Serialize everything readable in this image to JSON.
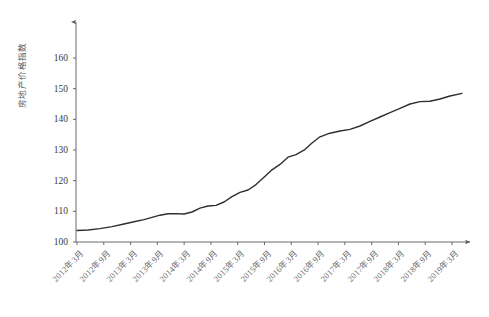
{
  "page": {
    "header_strip": "",
    "background_color": "#ffffff"
  },
  "chart_data": {
    "type": "line",
    "title": "",
    "subtitle": "",
    "xlabel": "",
    "ylabel": "房地产价格指数",
    "ylim": [
      100,
      165
    ],
    "ytick_values": [
      100,
      110,
      120,
      130,
      140,
      150,
      160
    ],
    "ytick_labels": [
      "100",
      "110",
      "120",
      "130",
      "140",
      "150",
      "160"
    ],
    "grid": false,
    "legend": false,
    "legend_position": "none",
    "line_color": "#2f2f2f",
    "line_width": 1.4,
    "axis_color": "#5b5b5b",
    "axis_arrow": true,
    "xtick_labels": [
      "2012年3月",
      "2012年9月",
      "2013年3月",
      "2013年9月",
      "2014年3月",
      "2014年9月",
      "2015年3月",
      "2015年9月",
      "2016年3月",
      "2016年9月",
      "2017年3月",
      "2017年9月",
      "2018年3月",
      "2018年9月",
      "2019年3月"
    ],
    "xtick_rotation_deg": -45,
    "x": [
      "2012年3月",
      "2012年6月",
      "2012年9月",
      "2012年12月",
      "2013年3月",
      "2013年6月",
      "2013年9月",
      "2013年12月",
      "2014年3月",
      "2014年6月",
      "2014年9月",
      "2014年12月",
      "2015年3月",
      "2015年6月",
      "2015年9月",
      "2015年12月",
      "2016年3月",
      "2016年6月",
      "2016年9月",
      "2016年12月",
      "2017年3月",
      "2017年6月",
      "2017年9月",
      "2017年12月",
      "2018年3月",
      "2018年6月",
      "2018年9月",
      "2018年12月",
      "2019年3月"
    ],
    "values": [
      104.0,
      104.2,
      104.6,
      105.3,
      106.2,
      107.1,
      108.0,
      109.0,
      110.0,
      110.6,
      110.7,
      110.6,
      111.2,
      112.5,
      113.2,
      113.4,
      114.6,
      116.4,
      117.8,
      118.6,
      120.4,
      122.8,
      125.2,
      127.0,
      129.4,
      130.2,
      131.6,
      134.0,
      136.0
    ],
    "series": [
      {
        "name": "房地产价格指数",
        "values": [
          104.0,
          104.2,
          104.6,
          105.3,
          106.2,
          107.1,
          108.0,
          109.0,
          110.0,
          110.6,
          110.7,
          110.6,
          111.2,
          112.5,
          113.2,
          113.4,
          114.6,
          116.4,
          117.8,
          118.6,
          120.4,
          122.8,
          125.2,
          127.0,
          129.4,
          130.2,
          131.6,
          134.0,
          136.0
        ]
      }
    ],
    "extended_tail": {
      "note_x": [
        "2019年6月",
        "2019年9月",
        "2019年12月",
        "2020年3月"
      ],
      "note_values": [
        138.0,
        142.0,
        145.8,
        146.0,
        149.0
      ]
    },
    "points_px": [
      [
        77,
        230.5
      ],
      [
        88,
        230.0
      ],
      [
        100,
        228.6
      ],
      [
        112,
        226.6
      ],
      [
        124,
        224.0
      ],
      [
        134,
        221.8
      ],
      [
        144,
        219.6
      ],
      [
        152,
        217.4
      ],
      [
        160,
        215.2
      ],
      [
        168,
        213.8
      ],
      [
        176,
        213.6
      ],
      [
        184,
        214.0
      ],
      [
        192,
        212.0
      ],
      [
        200,
        208.2
      ],
      [
        208,
        206.0
      ],
      [
        216,
        205.4
      ],
      [
        224,
        202.0
      ],
      [
        232,
        196.6
      ],
      [
        240,
        192.4
      ],
      [
        248,
        190.0
      ],
      [
        256,
        184.6
      ],
      [
        264,
        177.2
      ],
      [
        272,
        169.8
      ],
      [
        280,
        164.4
      ],
      [
        288,
        157.2
      ],
      [
        296,
        154.6
      ],
      [
        304,
        150.2
      ],
      [
        312,
        143.0
      ],
      [
        320,
        136.8
      ],
      [
        330,
        133.2
      ],
      [
        340,
        131.0
      ],
      [
        350,
        129.4
      ],
      [
        360,
        126.0
      ],
      [
        370,
        121.4
      ],
      [
        380,
        117.0
      ],
      [
        390,
        112.6
      ],
      [
        400,
        108.4
      ],
      [
        410,
        104.0
      ],
      [
        420,
        101.6
      ],
      [
        430,
        101.2
      ],
      [
        440,
        99.0
      ],
      [
        450,
        96.0
      ],
      [
        462,
        93.4
      ]
    ]
  }
}
